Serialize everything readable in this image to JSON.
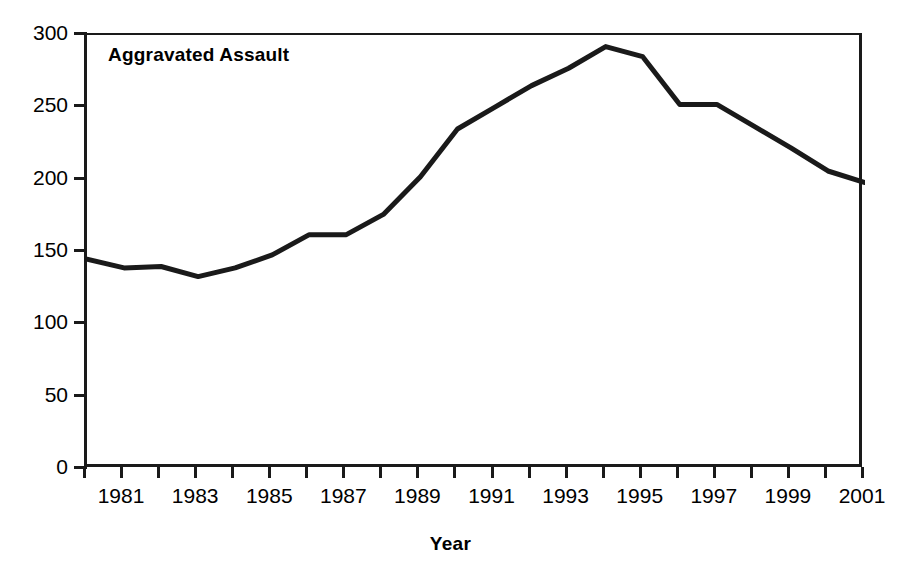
{
  "artifact": {
    "top_cutoff_text": "·· ···· ···· ···· ····· ···· ····"
  },
  "chart_data": {
    "type": "line",
    "title": "Aggravated Assault",
    "series_label": "Aggravated Assault",
    "xlabel": "Year",
    "ylabel": "",
    "x": [
      1980,
      1981,
      1982,
      1983,
      1984,
      1985,
      1986,
      1987,
      1988,
      1989,
      1990,
      1991,
      1992,
      1993,
      1994,
      1995,
      1996,
      1997,
      1998,
      1999,
      2000,
      2001
    ],
    "values": [
      145,
      139,
      140,
      133,
      139,
      148,
      162,
      162,
      176,
      202,
      235,
      250,
      265,
      277,
      292,
      285,
      252,
      252,
      237,
      222,
      206,
      198
    ],
    "series": [
      {
        "name": "Aggravated Assault",
        "values": [
          145,
          139,
          140,
          133,
          139,
          148,
          162,
          162,
          176,
          202,
          235,
          250,
          265,
          277,
          292,
          285,
          252,
          252,
          237,
          222,
          206,
          198
        ]
      }
    ],
    "xlim": [
      1980,
      2001
    ],
    "ylim": [
      0,
      300
    ],
    "ytick_values": [
      0,
      50,
      100,
      150,
      200,
      250,
      300
    ],
    "ytick_labels": [
      "0",
      "50",
      "100",
      "150",
      "200",
      "250",
      "300"
    ],
    "xtick_values": [
      1980,
      1981,
      1982,
      1983,
      1984,
      1985,
      1986,
      1987,
      1988,
      1989,
      1990,
      1991,
      1992,
      1993,
      1994,
      1995,
      1996,
      1997,
      1998,
      1999,
      2000,
      2001
    ],
    "xtick_labels_shown": [
      "1981",
      "1983",
      "1985",
      "1987",
      "1989",
      "1991",
      "1993",
      "1995",
      "1997",
      "1999",
      "2001"
    ],
    "xtick_labeled_values": [
      1981,
      1983,
      1985,
      1987,
      1989,
      1991,
      1993,
      1995,
      1997,
      1999,
      2001
    ],
    "grid": false,
    "legend": "none",
    "line_color": "#1a1a1a",
    "line_width": 5,
    "axis_color": "#1a1a1a",
    "background_color": "#ffffff"
  }
}
